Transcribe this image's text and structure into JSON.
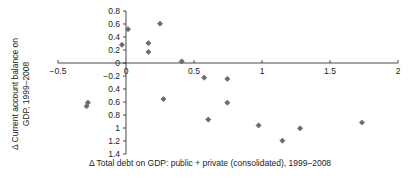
{
  "chart_data": {
    "type": "scatter",
    "title": "",
    "xlabel": "Δ Total debt on GDP: public + private (consolidated), 1999–2008",
    "ylabel_line1": "Δ Current account balance on",
    "ylabel_line2": "GDP, 1999–2008",
    "xlim": [
      -0.5,
      2.0
    ],
    "ylim": [
      -1.4,
      0.8
    ],
    "grid": false,
    "legend": "none",
    "xticks": [
      -0.5,
      0,
      0.5,
      1,
      1.5,
      2
    ],
    "xtick_labels": [
      "−0.5",
      "0",
      "0.5",
      "1",
      "1.5",
      "2"
    ],
    "yticks": [
      0.8,
      0.6,
      0.4,
      0.2,
      0,
      -0.2,
      -0.4,
      -0.6,
      -0.8,
      -1.0,
      -1.2,
      -1.4
    ],
    "ytick_labels": [
      "0.8",
      "0.6",
      "0.4",
      "0.2",
      "0",
      "−0.2",
      "0.4",
      "0.6",
      "0.8",
      "1",
      "1.2",
      "1.4"
    ],
    "marker": "diamond",
    "marker_color": "#6b6b6b",
    "marker_size": 4,
    "axis_color": "#333333",
    "points": [
      {
        "x": 0.015,
        "y": 0.52
      },
      {
        "x": -0.03,
        "y": 0.28
      },
      {
        "x": 0.165,
        "y": 0.305
      },
      {
        "x": 0.165,
        "y": 0.17
      },
      {
        "x": 0.25,
        "y": 0.605
      },
      {
        "x": 0.41,
        "y": 0.025
      },
      {
        "x": -0.28,
        "y": -0.61
      },
      {
        "x": -0.29,
        "y": -0.665
      },
      {
        "x": 0.275,
        "y": -0.555
      },
      {
        "x": 0.575,
        "y": -0.225
      },
      {
        "x": 0.745,
        "y": -0.245
      },
      {
        "x": 0.745,
        "y": -0.61
      },
      {
        "x": 0.605,
        "y": -0.87
      },
      {
        "x": 0.975,
        "y": -0.96
      },
      {
        "x": 1.15,
        "y": -1.195
      },
      {
        "x": 1.28,
        "y": -1.005
      },
      {
        "x": 1.735,
        "y": -0.915
      }
    ]
  }
}
